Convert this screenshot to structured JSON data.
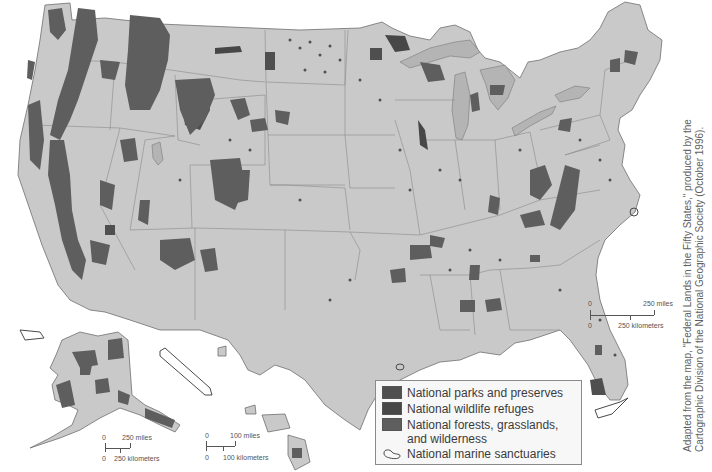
{
  "map": {
    "title": "Federal Lands in the Fifty States",
    "colors": {
      "land": "#c9c9c9",
      "lakes": "#b4b4b4",
      "national_parks": "#4f4f4f",
      "wildlife_refuges": "#474747",
      "forests": "#5e5e5e",
      "background": "#ffffff"
    },
    "regions": [
      "Contiguous United States",
      "Alaska",
      "Hawaii"
    ]
  },
  "legend": {
    "items": [
      {
        "label": "National parks and preserves",
        "icon": "dark-square",
        "color": "#4f4f4f"
      },
      {
        "label": "National wildlife refuges",
        "icon": "dark-square",
        "color": "#474747"
      },
      {
        "label": "National forests, grasslands, and wilderness",
        "icon": "medium-square",
        "color": "#5e5e5e"
      },
      {
        "label": "National marine sanctuaries",
        "icon": "sanctuary-outline-icon",
        "color": "#4a4a4a"
      }
    ]
  },
  "scales": {
    "contiguous": {
      "zero_top": "0",
      "miles": "250 miles",
      "zero_bottom": "0",
      "km": "250 kilometers"
    },
    "alaska": {
      "zero_top": "0",
      "miles": "250 miles",
      "zero_bottom": "0",
      "km": "250 kilometers"
    },
    "hawaii": {
      "zero_top": "0",
      "miles": "100 miles",
      "zero_bottom": "0",
      "km": "100 kilometers"
    }
  },
  "credit": {
    "text": "Adapted from the map, \"Federal Lands in the Fifty States,\" produced by the Cartographic Division of the National Geographic Society (October 1996)."
  }
}
